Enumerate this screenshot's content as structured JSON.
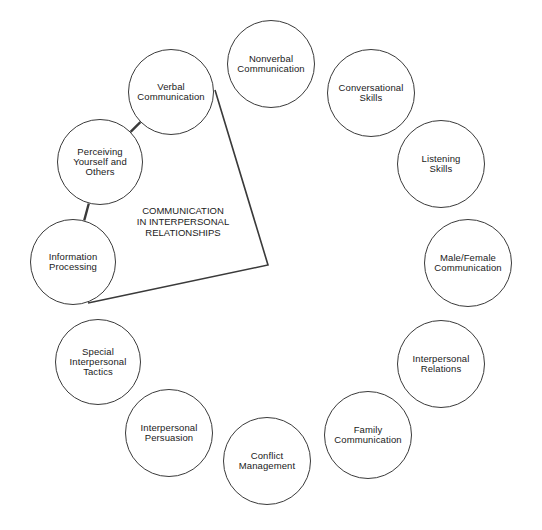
{
  "diagram": {
    "center_title": "COMMUNICATION\nIN INTERPERSONAL\nRELATIONSHIPS",
    "stroke_color": "#3a3a3a",
    "nodes": [
      {
        "id": "verbal",
        "label": "Verbal\nCommunication",
        "cx": 171,
        "cy": 92,
        "r": 43,
        "highlighted": true
      },
      {
        "id": "nonverbal",
        "label": "Nonverbal\nCommunication",
        "cx": 271,
        "cy": 64,
        "r": 44,
        "highlighted": false
      },
      {
        "id": "conversational",
        "label": "Conversational\nSkills",
        "cx": 371,
        "cy": 93,
        "r": 44,
        "highlighted": false
      },
      {
        "id": "listening",
        "label": "Listening\nSkills",
        "cx": 441,
        "cy": 164,
        "r": 44,
        "highlighted": false
      },
      {
        "id": "male-female",
        "label": "Male/Female\nCommunication",
        "cx": 468,
        "cy": 263,
        "r": 44,
        "highlighted": false
      },
      {
        "id": "interpersonal-relations",
        "label": "Interpersonal\nRelations",
        "cx": 441,
        "cy": 364,
        "r": 44,
        "highlighted": false
      },
      {
        "id": "family",
        "label": "Family\nCommunication",
        "cx": 368,
        "cy": 435,
        "r": 44,
        "highlighted": false
      },
      {
        "id": "conflict",
        "label": "Conflict\nManagement",
        "cx": 267,
        "cy": 461,
        "r": 44,
        "highlighted": false
      },
      {
        "id": "persuasion",
        "label": "Interpersonal\nPersuasion",
        "cx": 169,
        "cy": 433,
        "r": 44,
        "highlighted": false
      },
      {
        "id": "special-tactics",
        "label": "Special\nInterpersonal\nTactics",
        "cx": 98,
        "cy": 362,
        "r": 43,
        "highlighted": false
      },
      {
        "id": "information-processing",
        "label": "Information\nProcessing",
        "cx": 73,
        "cy": 262,
        "r": 43,
        "highlighted": true
      },
      {
        "id": "perceiving",
        "label": "Perceiving\nYourself and\nOthers",
        "cx": 100,
        "cy": 162,
        "r": 43,
        "highlighted": true
      }
    ],
    "connectors": [
      {
        "from": "verbal",
        "to": "perceiving"
      },
      {
        "from": "perceiving",
        "to": "information-processing"
      }
    ],
    "wedge": {
      "points": [
        [
          215,
          90
        ],
        [
          268,
          265
        ],
        [
          88,
          303
        ]
      ]
    }
  }
}
